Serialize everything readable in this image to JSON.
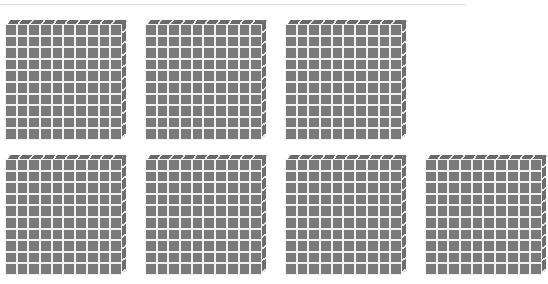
{
  "diagram": {
    "title": "",
    "block_grid": {
      "rows": 10,
      "cols": 10
    },
    "colors": {
      "cell": "#7a7a7a",
      "gridline": "#f2f2f2",
      "background": "#ffffff"
    },
    "blocks": [
      {
        "id": "flat-1",
        "x": 5,
        "y": 20,
        "value": 100
      },
      {
        "id": "flat-2",
        "x": 145,
        "y": 20,
        "value": 100
      },
      {
        "id": "flat-3",
        "x": 285,
        "y": 20,
        "value": 100
      },
      {
        "id": "flat-4",
        "x": 5,
        "y": 155,
        "value": 100
      },
      {
        "id": "flat-5",
        "x": 145,
        "y": 155,
        "value": 100
      },
      {
        "id": "flat-6",
        "x": 285,
        "y": 155,
        "value": 100
      },
      {
        "id": "flat-7",
        "x": 425,
        "y": 155,
        "value": 100,
        "partially_visible": true
      }
    ],
    "total_blocks_visible": 7
  }
}
